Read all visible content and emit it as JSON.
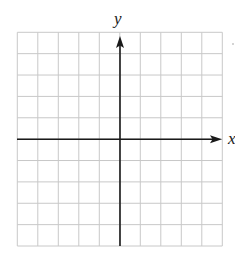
{
  "diagram": {
    "type": "coordinate-grid",
    "axes": {
      "x_label": "x",
      "y_label": "y"
    },
    "grid": {
      "columns": 10,
      "rows": 10,
      "left": 17.3,
      "top": 32.3,
      "right": 222.3,
      "bottom": 246,
      "origin_column_index": 5,
      "origin_row_index": 5
    },
    "colors": {
      "grid_line": "#c8c8c8",
      "axis": "#1a1a1a",
      "background": "#ffffff"
    }
  }
}
